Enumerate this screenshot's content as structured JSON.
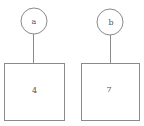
{
  "diagram": {
    "nodes": [
      {
        "id": "a",
        "label": "a",
        "value": "4"
      },
      {
        "id": "b",
        "label": "b",
        "value": "7"
      }
    ],
    "edges": [
      {
        "from": "a",
        "to": "a-box"
      },
      {
        "from": "b",
        "to": "b-box"
      }
    ],
    "colors": {
      "stroke": "#8a8a8a",
      "text": "#555555",
      "background": "#ffffff"
    }
  }
}
